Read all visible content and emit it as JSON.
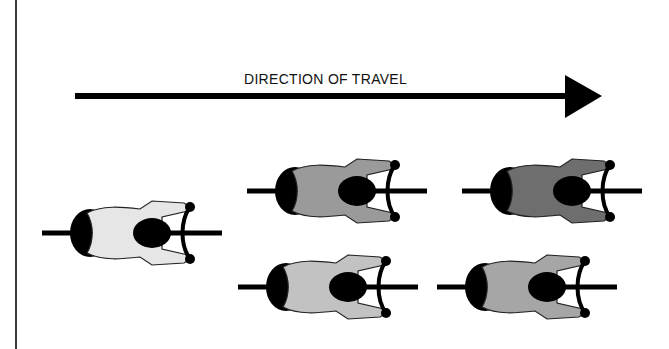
{
  "diagram": {
    "title": "DIRECTION OF TRAVEL",
    "arrow": {
      "direction": "right",
      "color": "#000000"
    },
    "cyclists": [
      {
        "id": "lead",
        "position": "leader",
        "x": 132,
        "y": 233,
        "fill": "#e6e6e6"
      },
      {
        "id": "row1-left",
        "position": "front-left",
        "x": 337,
        "y": 191,
        "fill": "#9a9a9a"
      },
      {
        "id": "row1-right",
        "position": "front-right",
        "x": 552,
        "y": 191,
        "fill": "#6e6e6e"
      },
      {
        "id": "row2-left",
        "position": "back-left",
        "x": 328,
        "y": 287,
        "fill": "#c2c2c2"
      },
      {
        "id": "row2-right",
        "position": "back-right",
        "x": 527,
        "y": 287,
        "fill": "#a6a6a6"
      }
    ]
  }
}
